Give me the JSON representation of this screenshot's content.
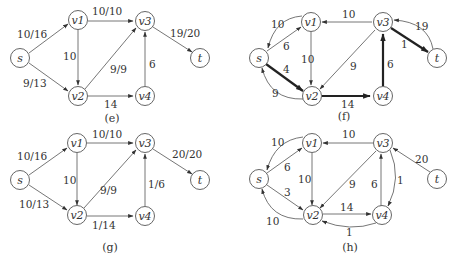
{
  "figure": {
    "panels": [
      {
        "id": "e",
        "caption": "(e)",
        "nodes": {
          "s": "s",
          "v1": "v1",
          "v2": "v2",
          "v3": "v3",
          "v4": "v4",
          "t": "t"
        },
        "edges": [
          {
            "from": "s",
            "to": "v1",
            "label": "10/16"
          },
          {
            "from": "s",
            "to": "v2",
            "label": "9/13"
          },
          {
            "from": "v1",
            "to": "v3",
            "label": "10/10"
          },
          {
            "from": "v1",
            "to": "v2",
            "label": "10"
          },
          {
            "from": "v2",
            "to": "v3",
            "label": "9/9"
          },
          {
            "from": "v2",
            "to": "v4",
            "label": "14"
          },
          {
            "from": "v4",
            "to": "v3",
            "label": "6"
          },
          {
            "from": "v3",
            "to": "t",
            "label": "19/20"
          }
        ]
      },
      {
        "id": "f",
        "caption": "(f)",
        "nodes": {
          "s": "s",
          "v1": "v1",
          "v2": "v2",
          "v3": "v3",
          "v4": "v4",
          "t": "t"
        },
        "edges": [
          {
            "from": "v1",
            "to": "s",
            "label": "10"
          },
          {
            "from": "s",
            "to": "v1",
            "label": "6"
          },
          {
            "from": "s",
            "to": "v2",
            "label": "4",
            "augmenting": true
          },
          {
            "from": "v2",
            "to": "s",
            "label": "9"
          },
          {
            "from": "v3",
            "to": "v1",
            "label": "10"
          },
          {
            "from": "v1",
            "to": "v2",
            "label": "10"
          },
          {
            "from": "v3",
            "to": "v2",
            "label": "9"
          },
          {
            "from": "v2",
            "to": "v4",
            "label": "14",
            "augmenting": true
          },
          {
            "from": "v4",
            "to": "v3",
            "label": "6",
            "augmenting": true
          },
          {
            "from": "v3",
            "to": "t",
            "label": "1",
            "augmenting": true
          },
          {
            "from": "t",
            "to": "v3",
            "label": "19"
          }
        ]
      },
      {
        "id": "g",
        "caption": "(g)",
        "nodes": {
          "s": "s",
          "v1": "v1",
          "v2": "v2",
          "v3": "v3",
          "v4": "v4",
          "t": "t"
        },
        "edges": [
          {
            "from": "s",
            "to": "v1",
            "label": "10/16"
          },
          {
            "from": "s",
            "to": "v2",
            "label": "10/13"
          },
          {
            "from": "v1",
            "to": "v3",
            "label": "10/10"
          },
          {
            "from": "v1",
            "to": "v2",
            "label": "10"
          },
          {
            "from": "v2",
            "to": "v3",
            "label": "9/9"
          },
          {
            "from": "v2",
            "to": "v4",
            "label": "1/14"
          },
          {
            "from": "v4",
            "to": "v3",
            "label": "1/6"
          },
          {
            "from": "v3",
            "to": "t",
            "label": "20/20"
          }
        ]
      },
      {
        "id": "h",
        "caption": "(h)",
        "nodes": {
          "s": "s",
          "v1": "v1",
          "v2": "v2",
          "v3": "v3",
          "v4": "v4",
          "t": "t"
        },
        "edges": [
          {
            "from": "v1",
            "to": "s",
            "label": "10"
          },
          {
            "from": "s",
            "to": "v1",
            "label": "6"
          },
          {
            "from": "s",
            "to": "v2",
            "label": "3"
          },
          {
            "from": "v2",
            "to": "s",
            "label": "10"
          },
          {
            "from": "v3",
            "to": "v1",
            "label": "10"
          },
          {
            "from": "v1",
            "to": "v2",
            "label": "10"
          },
          {
            "from": "v3",
            "to": "v2",
            "label": "9"
          },
          {
            "from": "v2",
            "to": "v4",
            "label": "14"
          },
          {
            "from": "v4",
            "to": "v2",
            "label": "1"
          },
          {
            "from": "v4",
            "to": "v3",
            "label": "6"
          },
          {
            "from": "v3",
            "to": "v4",
            "label": "1"
          },
          {
            "from": "t",
            "to": "v3",
            "label": "20"
          }
        ]
      }
    ]
  }
}
